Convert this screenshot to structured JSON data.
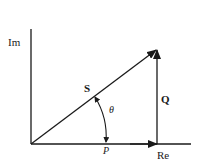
{
  "diagram": {
    "type": "power-triangle-phasor",
    "labels": {
      "imag_axis": "Im",
      "real_axis": "Re",
      "apparent_power": "S",
      "reactive_power": "Q",
      "real_power": "P",
      "angle": "θ"
    },
    "colors": {
      "stroke": "#1a1a1a",
      "background": "#ffffff"
    }
  }
}
